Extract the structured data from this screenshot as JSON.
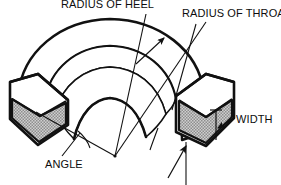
{
  "figure": {
    "type": "technical-isometric-diagram",
    "background_color": "#ffffff",
    "line_color": "#111111",
    "shading_color": "#a8a8a8",
    "width_px": 281,
    "height_px": 185
  },
  "labels": {
    "radius_of_heel": "RADIUS OF HEEL",
    "radius_of_throat": "RADIUS OF THROAT",
    "width": "WIDTH",
    "angle": "ANGLE"
  },
  "callouts": [
    {
      "id": "radius-of-heel",
      "text": "RADIUS OF HEEL",
      "text_x": 61,
      "text_y": -1,
      "leader": "from text down-right across outer heel arc to the arc center apex",
      "anchor_x": 115,
      "anchor_y": 156
    },
    {
      "id": "radius-of-throat",
      "text": "RADIUS OF THROAT",
      "text_x": 182,
      "text_y": 8,
      "leader": "from text down-left to inner throat arc",
      "anchor_x": 167,
      "anchor_y": 108
    },
    {
      "id": "width",
      "text": "WIDTH",
      "text_x": 236,
      "text_y": 114,
      "leader": "arrow pointing left-down to vertical width dimension line at right end face",
      "anchor_x": 216,
      "anchor_y": 128
    },
    {
      "id": "angle",
      "text": "ANGLE",
      "text_x": 45,
      "text_y": 159,
      "leader": "from text up-right to angle vertex arc between the two radius lines",
      "anchor_x": 88,
      "anchor_y": 139
    }
  ],
  "geometry": {
    "center_x": 115,
    "center_y": 156,
    "outer_radius": 138,
    "inner_radius": 82,
    "band_depth": 40,
    "sweep_start_deg": 188,
    "sweep_end_deg": 352,
    "end_face_left": {
      "x": 10,
      "y": 78,
      "width": 58,
      "height": 68
    },
    "end_face_right": {
      "x": 172,
      "y": 74,
      "width": 62,
      "height": 70
    }
  }
}
